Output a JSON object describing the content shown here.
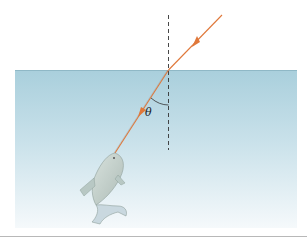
{
  "diagram": {
    "angle_label": "θ",
    "elements": {
      "medium_top": "air",
      "medium_bottom": "water",
      "normal_line": "dashed vertical normal to surface",
      "incident_ray": "orange ray from upper right to surface",
      "refracted_ray": "orange ray bending toward the normal, reaching fish",
      "subject": "fish"
    },
    "colors": {
      "water_top": "#a9cfdc",
      "water_bottom": "#f3f8fa",
      "surface_line": "#8fb8c6",
      "ray": "#e0783a",
      "normal": "#333333",
      "bottom_rule": "#b8b8b8"
    }
  }
}
